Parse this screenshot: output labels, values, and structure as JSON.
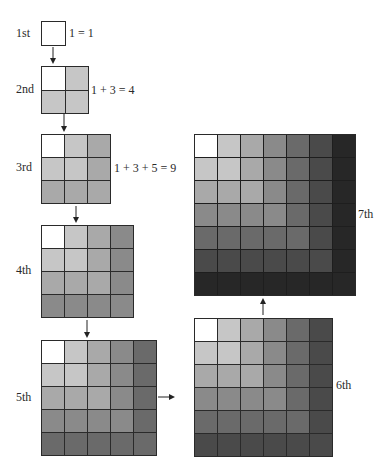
{
  "figure": {
    "shades": [
      "#ffffff",
      "#c6c6c6",
      "#a9a9a9",
      "#8a8a8a",
      "#6a6a6a",
      "#4a4a4a",
      "#272727"
    ],
    "steps": [
      {
        "label": "1st",
        "n": 1,
        "equation": "1 = 1",
        "x": 41,
        "y": 21,
        "cell": 24,
        "label_x": 16,
        "label_y": 27,
        "eq_x": 69,
        "eq_y": 27
      },
      {
        "label": "2nd",
        "n": 2,
        "equation": "1 + 3 = 4",
        "x": 41,
        "y": 66,
        "cell": 23.5,
        "label_x": 16,
        "label_y": 83,
        "eq_x": 91,
        "eq_y": 84
      },
      {
        "label": "3rd",
        "n": 3,
        "equation": "1 + 3 + 5 = 9",
        "x": 41,
        "y": 134,
        "cell": 23,
        "label_x": 16,
        "label_y": 161,
        "eq_x": 114,
        "eq_y": 162
      },
      {
        "label": "4th",
        "n": 4,
        "equation": "",
        "x": 41,
        "y": 225,
        "cell": 23,
        "label_x": 16,
        "label_y": 264,
        "eq_x": 0,
        "eq_y": 0
      },
      {
        "label": "5th",
        "n": 5,
        "equation": "",
        "x": 41,
        "y": 340,
        "cell": 23,
        "label_x": 16,
        "label_y": 391,
        "eq_x": 0,
        "eq_y": 0
      },
      {
        "label": "6th",
        "n": 6,
        "equation": "",
        "x": 194,
        "y": 318,
        "cell": 23,
        "label_x": 336,
        "label_y": 379,
        "eq_x": 0,
        "eq_y": 0
      },
      {
        "label": "7th",
        "n": 7,
        "equation": "",
        "x": 194,
        "y": 134,
        "cell": 23,
        "label_x": 358,
        "label_y": 208,
        "eq_x": 0,
        "eq_y": 0
      }
    ],
    "arrows": [
      {
        "name": "arrow-1st-to-2nd",
        "dir": "down",
        "x": 53,
        "y": 47,
        "len": 17
      },
      {
        "name": "arrow-2nd-to-3rd",
        "dir": "down",
        "x": 64,
        "y": 114,
        "len": 18
      },
      {
        "name": "arrow-3rd-to-4th",
        "dir": "down",
        "x": 76,
        "y": 206,
        "len": 17
      },
      {
        "name": "arrow-4th-to-5th",
        "dir": "down",
        "x": 87,
        "y": 320,
        "len": 18
      },
      {
        "name": "arrow-5th-to-6th",
        "dir": "right",
        "x": 158,
        "y": 397,
        "len": 17
      },
      {
        "name": "arrow-6th-to-7th",
        "dir": "up",
        "x": 263,
        "y": 298,
        "len": 17
      }
    ]
  }
}
